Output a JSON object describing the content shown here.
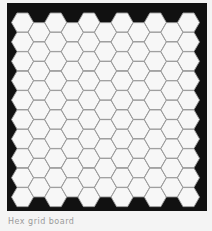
{
  "board": {
    "frame": {
      "x": 7,
      "y": 3,
      "width": 200,
      "height": 208
    },
    "colors": {
      "background": "#111111",
      "hex_fill": "#f7f7f7",
      "hex_stroke": "#9a9a9a",
      "page": "#f4f4f4"
    },
    "hex": {
      "size": 11,
      "col_step": 16.6,
      "row_step": 19.4,
      "origin_x": 22.5,
      "origin_y": 22.5,
      "odd_offset": -9.7
    },
    "columns": 12,
    "rows": 11
  },
  "caption": {
    "text": "Hex grid board"
  }
}
